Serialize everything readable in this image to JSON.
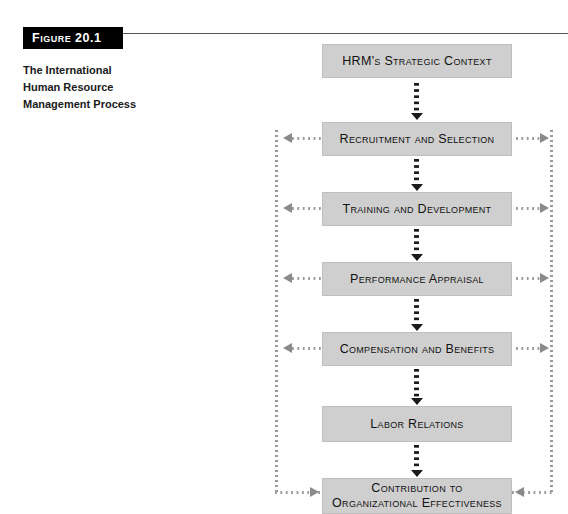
{
  "figure": {
    "tag_label": "Figure 20.1",
    "caption_lines": [
      "The International",
      "Human Resource",
      "Management Process"
    ],
    "caption_full": "The International Human Resource Management Process"
  },
  "colors": {
    "box_fill": "#cfcfcf",
    "box_border": "#bfbfbf",
    "tag_bg": "#000000",
    "tag_text": "#ffffff",
    "connector": "#1a1a1a",
    "rail": "#9a9a9a",
    "arrow": "#8a8a8a",
    "text": "#111111"
  },
  "flow": {
    "nodes": [
      {
        "id": "hrm-strategic-context",
        "label": "HRM's Strategic Context",
        "label_line2": "",
        "side_arrows": "none"
      },
      {
        "id": "recruitment-and-selection",
        "label": "Recruitment and Selection",
        "label_line2": "",
        "side_arrows": "outward"
      },
      {
        "id": "training-and-development",
        "label": "Training and Development",
        "label_line2": "",
        "side_arrows": "outward"
      },
      {
        "id": "performance-appraisal",
        "label": "Performance Appraisal",
        "label_line2": "",
        "side_arrows": "outward"
      },
      {
        "id": "compensation-and-benefits",
        "label": "Compensation and Benefits",
        "label_line2": "",
        "side_arrows": "outward"
      },
      {
        "id": "labor-relations",
        "label": "Labor Relations",
        "label_line2": "",
        "side_arrows": "none"
      },
      {
        "id": "contribution-to-effectiveness",
        "label": "Contribution to",
        "label_line2": "Organizational Effectiveness",
        "side_arrows": "inward"
      }
    ],
    "connector_count": 6,
    "connector_style": "dotted-arrow-down",
    "rail_style": "dotted-feedback-loop"
  }
}
